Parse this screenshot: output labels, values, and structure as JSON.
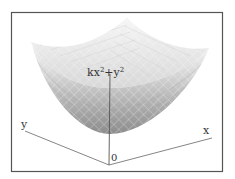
{
  "figure": {
    "type": "3d-surface",
    "surface_label": "kx² + y²",
    "surface_label_parts": {
      "base1": "kx",
      "sup1": "2",
      "plus": "+y",
      "sup2": "2"
    },
    "axes": {
      "x_label": "x",
      "y_label": "y",
      "origin_label": "0"
    },
    "colors": {
      "frame": "#555555",
      "axis": "#777777",
      "surface_dark": "#8a8a8a",
      "surface_light": "#f2f2f2",
      "mesh": "#ffffff"
    }
  }
}
